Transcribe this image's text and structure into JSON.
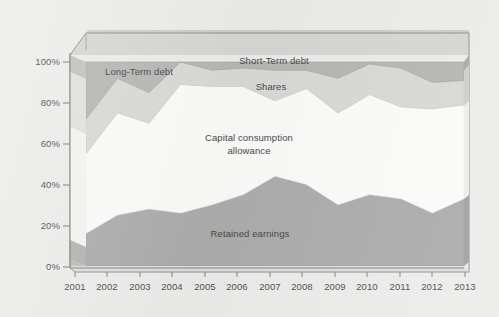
{
  "chart_data": {
    "type": "area",
    "title": "",
    "subtitle": "",
    "xlabel": "",
    "ylabel": "",
    "stacked": true,
    "percent_stacked": true,
    "grid": false,
    "legend_position": "inline-annotations",
    "projection": "3d-perspective",
    "ylim": [
      0,
      100
    ],
    "y_tick_labels": [
      "0%",
      "20%",
      "40%",
      "60%",
      "80%",
      "100%"
    ],
    "y_tick_values": [
      0,
      20,
      40,
      60,
      80,
      100
    ],
    "categories": [
      "2001",
      "2002",
      "2003",
      "2004",
      "2005",
      "2006",
      "2007",
      "2008",
      "2009",
      "2010",
      "2011",
      "2012",
      "2013"
    ],
    "x": [
      2001,
      2002,
      2003,
      2004,
      2005,
      2006,
      2007,
      2008,
      2009,
      2010,
      2011,
      2012,
      2013
    ],
    "series": [
      {
        "name": "Retained earnings",
        "color": "#9d9d9d",
        "values": [
          16,
          25,
          28,
          26,
          30,
          35,
          44,
          40,
          30,
          35,
          33,
          26,
          33
        ],
        "cumulative_top": [
          16,
          25,
          28,
          26,
          30,
          35,
          44,
          40,
          30,
          35,
          33,
          26,
          33
        ]
      },
      {
        "name": "Capital consumption allowance",
        "color": "#fbfbfa",
        "values": [
          39,
          50,
          42,
          63,
          58,
          53,
          37,
          47,
          45,
          49,
          45,
          51,
          46
        ],
        "cumulative_top": [
          55,
          75,
          70,
          89,
          88,
          88,
          81,
          87,
          75,
          84,
          78,
          77,
          79
        ]
      },
      {
        "name": "Shares",
        "color": "#d2d2d0",
        "values": [
          17,
          17,
          15,
          11,
          8,
          9,
          15,
          9,
          17,
          15,
          19,
          13,
          12
        ],
        "cumulative_top": [
          72,
          92,
          85,
          100,
          96,
          97,
          96,
          96,
          92,
          99,
          97,
          90,
          91
        ]
      },
      {
        "name": "Short-Term debt",
        "color": "#a9a9a7",
        "values": [
          28,
          8,
          15,
          0,
          4,
          3,
          4,
          4,
          8,
          1,
          3,
          10,
          9
        ],
        "cumulative_top": [
          100,
          100,
          100,
          100,
          100,
          100,
          100,
          100,
          100,
          100,
          100,
          100,
          100
        ]
      }
    ],
    "annotations": [
      {
        "text": "Long-Term debt",
        "target_series": "Long-Term debt"
      },
      {
        "text": "Short-Term debt",
        "target_series": "Short-Term debt"
      },
      {
        "text": "Shares",
        "target_series": "Shares"
      },
      {
        "text": "Capital consumption",
        "target_series": "Capital consumption allowance"
      },
      {
        "text": "allowance",
        "target_series": "Capital consumption allowance"
      },
      {
        "text": "Retained earnings",
        "target_series": "Retained earnings"
      }
    ],
    "colors": {
      "background": "#e9e9e7",
      "plot_back_wall": "#cfcfcd",
      "plot_floor": "#d7d7d5",
      "axis": "#6a6a6a",
      "text": "#2b2b2b",
      "retained_earnings": "#9d9d9d",
      "capital_consumption_allowance": "#fbfbfa",
      "shares": "#d2d2d0",
      "short_term_debt": "#a9a9a7",
      "long_term_debt": "#a9a9a7"
    }
  },
  "axes": {
    "y_ticks": [
      {
        "label": "100%"
      },
      {
        "label": "80%"
      },
      {
        "label": "60%"
      },
      {
        "label": "40%"
      },
      {
        "label": "20%"
      },
      {
        "label": "0%"
      }
    ],
    "x_ticks": [
      {
        "label": "2001"
      },
      {
        "label": "2002"
      },
      {
        "label": "2003"
      },
      {
        "label": "2004"
      },
      {
        "label": "2005"
      },
      {
        "label": "2006"
      },
      {
        "label": "2007"
      },
      {
        "label": "2008"
      },
      {
        "label": "2009"
      },
      {
        "label": "2010"
      },
      {
        "label": "2011"
      },
      {
        "label": "2012"
      },
      {
        "label": "2013"
      }
    ]
  },
  "labels": {
    "long_term_debt": "Long-Term debt",
    "short_term_debt": "Short-Term debt",
    "shares": "Shares",
    "capital_consumption_line1": "Capital consumption",
    "capital_consumption_line2": "allowance",
    "retained_earnings": "Retained earnings"
  }
}
